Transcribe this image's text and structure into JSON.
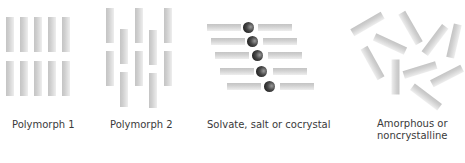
{
  "figure": {
    "colors": {
      "rod": "#d0d0d0",
      "ion": "#2a2a2a",
      "text": "#3a3a3a",
      "background": "#ffffff"
    },
    "panels": [
      {
        "id": "polymorph-1",
        "label": "Polymorph 1",
        "arrangement": "5 columns x 2 rows aligned vertical rods",
        "rods": [
          {
            "x": 6,
            "y": 17,
            "w": 8,
            "h": 35,
            "angle": 0
          },
          {
            "x": 20,
            "y": 17,
            "w": 8,
            "h": 35,
            "angle": 0
          },
          {
            "x": 34,
            "y": 17,
            "w": 8,
            "h": 35,
            "angle": 0
          },
          {
            "x": 48,
            "y": 17,
            "w": 8,
            "h": 35,
            "angle": 0
          },
          {
            "x": 62,
            "y": 17,
            "w": 8,
            "h": 35,
            "angle": 0
          },
          {
            "x": 6,
            "y": 61,
            "w": 8,
            "h": 35,
            "angle": 0
          },
          {
            "x": 20,
            "y": 61,
            "w": 8,
            "h": 35,
            "angle": 0
          },
          {
            "x": 34,
            "y": 61,
            "w": 8,
            "h": 35,
            "angle": 0
          },
          {
            "x": 48,
            "y": 61,
            "w": 8,
            "h": 35,
            "angle": 0
          },
          {
            "x": 62,
            "y": 61,
            "w": 8,
            "h": 35,
            "angle": 0
          }
        ]
      },
      {
        "id": "polymorph-2",
        "label": "Polymorph 2",
        "arrangement": "5 columns of staggered vertical rods",
        "rods": [
          {
            "x": 106,
            "y": 8,
            "w": 8,
            "h": 35,
            "angle": 0
          },
          {
            "x": 106,
            "y": 51,
            "w": 8,
            "h": 35,
            "angle": 0
          },
          {
            "x": 120,
            "y": 29,
            "w": 8,
            "h": 35,
            "angle": 0
          },
          {
            "x": 120,
            "y": 72,
            "w": 8,
            "h": 35,
            "angle": 0
          },
          {
            "x": 135,
            "y": 8,
            "w": 8,
            "h": 35,
            "angle": 0
          },
          {
            "x": 135,
            "y": 51,
            "w": 8,
            "h": 35,
            "angle": 0
          },
          {
            "x": 149,
            "y": 30,
            "w": 8,
            "h": 35,
            "angle": 0
          },
          {
            "x": 149,
            "y": 73,
            "w": 8,
            "h": 35,
            "angle": 0
          },
          {
            "x": 164,
            "y": 8,
            "w": 8,
            "h": 35,
            "angle": 0
          },
          {
            "x": 164,
            "y": 51,
            "w": 8,
            "h": 35,
            "angle": 0
          }
        ]
      },
      {
        "id": "solvate",
        "label": "Solvate, salt or cocrystal",
        "arrangement": "5 rows of horizontal rod pairs with a dark sphere (solvent/counter-ion/coformer) between",
        "rows": [
          {
            "left_x": 207,
            "right_x": 258,
            "ball_cx": 249,
            "cy": 28
          },
          {
            "left_x": 211,
            "right_x": 263,
            "ball_cx": 253,
            "cy": 42
          },
          {
            "left_x": 215,
            "right_x": 268,
            "ball_cx": 258,
            "cy": 56
          },
          {
            "left_x": 220,
            "right_x": 273,
            "ball_cx": 262,
            "cy": 72
          },
          {
            "left_x": 227,
            "right_x": 280,
            "ball_cx": 270,
            "cy": 87
          }
        ],
        "rod_length": 34,
        "rod_thickness": 7,
        "ball_diameter": 11
      },
      {
        "id": "amorphous",
        "label_line1": "Amorphous or",
        "label_line2": "noncrystalline",
        "arrangement": "10 randomly oriented rods",
        "rods": [
          {
            "cx": 367,
            "cy": 24,
            "len": 35,
            "angle": -30
          },
          {
            "cx": 410,
            "cy": 28,
            "len": 35,
            "angle": 60
          },
          {
            "cx": 390,
            "cy": 44,
            "len": 34,
            "angle": 25
          },
          {
            "cx": 435,
            "cy": 40,
            "len": 34,
            "angle": -53
          },
          {
            "cx": 454,
            "cy": 41,
            "len": 34,
            "angle": -77
          },
          {
            "cx": 372,
            "cy": 63,
            "len": 35,
            "angle": 61
          },
          {
            "cx": 395,
            "cy": 77,
            "len": 35,
            "angle": 90
          },
          {
            "cx": 420,
            "cy": 70,
            "len": 34,
            "angle": -17
          },
          {
            "cx": 447,
            "cy": 76,
            "len": 34,
            "angle": -27
          },
          {
            "cx": 426,
            "cy": 97,
            "len": 34,
            "angle": 37
          }
        ]
      }
    ]
  }
}
